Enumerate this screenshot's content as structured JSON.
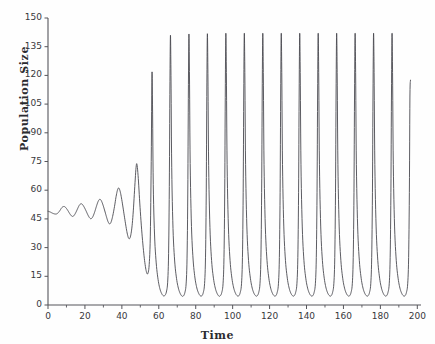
{
  "chart_data": {
    "type": "line",
    "title": "",
    "xlabel": "Time",
    "ylabel": "Population Size",
    "xlim": [
      0,
      202
    ],
    "ylim": [
      0,
      150
    ],
    "grid": false,
    "legend": null,
    "line_color": "#4a4a50",
    "background_color": "#fefefe",
    "xticks": [
      0,
      20,
      40,
      60,
      80,
      100,
      120,
      140,
      160,
      180,
      200
    ],
    "xtick_labels": [
      "0",
      "20",
      "40",
      "60",
      "80",
      "100",
      "120",
      "140",
      "160",
      "180",
      "200"
    ],
    "x_minor_tick_step": 10,
    "yticks": [
      0,
      15,
      30,
      45,
      60,
      75,
      90,
      105,
      120,
      135,
      150
    ],
    "ytick_labels": [
      "0",
      "15",
      "30",
      "45",
      "60",
      "75",
      "90",
      "105",
      "120",
      "135",
      "150"
    ],
    "series": [
      {
        "name": "Population Size",
        "initial_value": 49,
        "equilibrium": 49,
        "limit_cycle_peak": 142,
        "limit_cycle_trough": 2,
        "period": 8.6,
        "points": [
          [
            0,
            49.0
          ],
          [
            1.2,
            48.6
          ],
          [
            2.4,
            48.0
          ],
          [
            3.6,
            47.6
          ],
          [
            4.6,
            47.6
          ],
          [
            5.6,
            48.3
          ],
          [
            6.6,
            49.6
          ],
          [
            7.4,
            50.8
          ],
          [
            8.2,
            51.4
          ],
          [
            9.0,
            51.4
          ],
          [
            9.8,
            50.7
          ],
          [
            10.8,
            49.3
          ],
          [
            11.8,
            47.7
          ],
          [
            12.7,
            46.6
          ],
          [
            13.4,
            46.3
          ],
          [
            14.2,
            46.9
          ],
          [
            15.2,
            48.6
          ],
          [
            16.2,
            50.7
          ],
          [
            17.0,
            52.2
          ],
          [
            17.8,
            52.9
          ],
          [
            18.6,
            52.6
          ],
          [
            19.5,
            51.3
          ],
          [
            20.6,
            49.2
          ],
          [
            21.6,
            47.1
          ],
          [
            22.5,
            45.6
          ],
          [
            23.3,
            45.1
          ],
          [
            24.2,
            46.0
          ],
          [
            25.2,
            48.4
          ],
          [
            26.2,
            51.5
          ],
          [
            27.1,
            54.0
          ],
          [
            27.9,
            55.2
          ],
          [
            28.7,
            54.8
          ],
          [
            29.6,
            52.8
          ],
          [
            30.6,
            49.7
          ],
          [
            31.6,
            46.3
          ],
          [
            32.5,
            43.6
          ],
          [
            33.3,
            42.4
          ],
          [
            34.1,
            43.2
          ],
          [
            35.0,
            46.3
          ],
          [
            36.0,
            51.4
          ],
          [
            36.9,
            56.8
          ],
          [
            37.7,
            60.3
          ],
          [
            38.4,
            61.1
          ],
          [
            39.2,
            58.9
          ],
          [
            40.1,
            54.2
          ],
          [
            41.1,
            48.0
          ],
          [
            42.1,
            41.8
          ],
          [
            43.0,
            37.0
          ],
          [
            43.8,
            34.7
          ],
          [
            44.6,
            35.6
          ],
          [
            45.4,
            40.2
          ],
          [
            46.2,
            49.2
          ],
          [
            47.0,
            62.0
          ],
          [
            47.7,
            72.0
          ],
          [
            48.2,
            73.4
          ],
          [
            48.9,
            66.1
          ],
          [
            49.7,
            53.3
          ],
          [
            50.7,
            39.6
          ],
          [
            51.7,
            28.6
          ],
          [
            52.6,
            21.1
          ],
          [
            53.4,
            17.0
          ],
          [
            54.1,
            16.5
          ],
          [
            54.8,
            21.1
          ],
          [
            55.4,
            36.0
          ],
          [
            55.9,
            75.0
          ],
          [
            56.3,
            120.6
          ],
          [
            56.6,
            105.0
          ],
          [
            57.0,
            63.0
          ],
          [
            57.7,
            36.6
          ],
          [
            58.6,
            22.0
          ],
          [
            59.6,
            13.4
          ],
          [
            60.6,
            8.5
          ],
          [
            61.6,
            5.9
          ],
          [
            62.5,
            4.8
          ],
          [
            63.3,
            5.0
          ],
          [
            64.1,
            6.8
          ],
          [
            64.8,
            11.9
          ],
          [
            65.3,
            26.8
          ],
          [
            65.7,
            62.0
          ],
          [
            66.0,
            110.0
          ],
          [
            66.3,
            141.0
          ],
          [
            66.6,
            120.0
          ],
          [
            67.0,
            72.0
          ],
          [
            67.7,
            40.0
          ],
          [
            68.6,
            23.0
          ],
          [
            69.6,
            13.9
          ],
          [
            70.6,
            8.8
          ],
          [
            71.6,
            6.0
          ],
          [
            72.5,
            4.7
          ],
          [
            73.3,
            4.7
          ],
          [
            74.1,
            6.4
          ],
          [
            74.8,
            11.0
          ],
          [
            75.3,
            24.5
          ],
          [
            75.7,
            58.0
          ],
          [
            76.0,
            108.0
          ],
          [
            76.3,
            141.5
          ],
          [
            76.6,
            122.0
          ],
          [
            77.0,
            74.0
          ],
          [
            77.7,
            41.0
          ],
          [
            78.6,
            23.5
          ],
          [
            79.6,
            14.1
          ],
          [
            80.6,
            8.9
          ],
          [
            81.6,
            6.1
          ],
          [
            82.5,
            4.8
          ],
          [
            83.3,
            4.8
          ],
          [
            84.1,
            6.5
          ],
          [
            84.8,
            11.2
          ],
          [
            85.3,
            25.0
          ],
          [
            85.7,
            59.0
          ],
          [
            86.0,
            109.0
          ],
          [
            86.3,
            141.8
          ],
          [
            86.6,
            121.0
          ],
          [
            87.0,
            73.0
          ],
          [
            87.7,
            40.5
          ],
          [
            88.6,
            23.2
          ],
          [
            89.6,
            14.0
          ],
          [
            90.6,
            8.8
          ],
          [
            91.6,
            6.0
          ],
          [
            92.5,
            4.7
          ],
          [
            93.3,
            4.8
          ],
          [
            94.1,
            6.5
          ],
          [
            94.8,
            11.1
          ],
          [
            95.3,
            24.8
          ],
          [
            95.7,
            58.5
          ],
          [
            96.0,
            108.5
          ],
          [
            96.3,
            142.0
          ],
          [
            96.6,
            121.5
          ],
          [
            97.0,
            73.5
          ],
          [
            97.7,
            40.8
          ],
          [
            98.6,
            23.3
          ],
          [
            99.6,
            14.0
          ],
          [
            100.6,
            8.8
          ],
          [
            101.6,
            6.0
          ],
          [
            102.5,
            4.8
          ],
          [
            103.3,
            4.8
          ],
          [
            104.1,
            6.5
          ],
          [
            104.8,
            11.1
          ],
          [
            105.3,
            24.9
          ],
          [
            105.7,
            58.7
          ],
          [
            106.0,
            108.7
          ],
          [
            106.3,
            142.0
          ],
          [
            106.6,
            121.5
          ],
          [
            107.0,
            73.5
          ],
          [
            107.7,
            40.8
          ],
          [
            108.6,
            23.3
          ],
          [
            109.6,
            14.0
          ],
          [
            110.6,
            8.8
          ],
          [
            111.6,
            6.0
          ],
          [
            112.5,
            4.8
          ],
          [
            113.3,
            4.8
          ],
          [
            114.1,
            6.5
          ],
          [
            114.8,
            11.1
          ],
          [
            115.3,
            24.9
          ],
          [
            115.7,
            58.7
          ],
          [
            116.0,
            108.7
          ],
          [
            116.3,
            142.0
          ],
          [
            116.6,
            121.5
          ],
          [
            117.0,
            73.5
          ],
          [
            117.7,
            40.8
          ],
          [
            118.6,
            23.3
          ],
          [
            119.6,
            14.0
          ],
          [
            120.6,
            8.8
          ],
          [
            121.6,
            6.0
          ],
          [
            122.5,
            4.8
          ],
          [
            123.3,
            4.8
          ],
          [
            124.1,
            6.5
          ],
          [
            124.8,
            11.1
          ],
          [
            125.3,
            24.9
          ],
          [
            125.7,
            58.7
          ],
          [
            126.0,
            108.7
          ],
          [
            126.3,
            142.0
          ],
          [
            126.6,
            121.5
          ],
          [
            127.0,
            73.5
          ],
          [
            127.7,
            40.8
          ],
          [
            128.6,
            23.3
          ],
          [
            129.6,
            14.0
          ],
          [
            130.6,
            8.8
          ],
          [
            131.6,
            6.0
          ],
          [
            132.5,
            4.8
          ],
          [
            133.3,
            4.8
          ],
          [
            134.1,
            6.5
          ],
          [
            134.8,
            11.1
          ],
          [
            135.3,
            24.9
          ],
          [
            135.7,
            58.7
          ],
          [
            136.0,
            108.7
          ],
          [
            136.3,
            142.0
          ],
          [
            136.6,
            121.5
          ],
          [
            137.0,
            73.5
          ],
          [
            137.7,
            40.8
          ],
          [
            138.6,
            23.3
          ],
          [
            139.6,
            14.0
          ],
          [
            140.6,
            8.8
          ],
          [
            141.6,
            6.0
          ],
          [
            142.5,
            4.8
          ],
          [
            143.3,
            4.8
          ],
          [
            144.1,
            6.5
          ],
          [
            144.8,
            11.1
          ],
          [
            145.3,
            24.9
          ],
          [
            145.7,
            58.7
          ],
          [
            146.0,
            108.7
          ],
          [
            146.3,
            142.0
          ],
          [
            146.6,
            121.5
          ],
          [
            147.0,
            73.5
          ],
          [
            147.7,
            40.8
          ],
          [
            148.6,
            23.3
          ],
          [
            149.6,
            14.0
          ],
          [
            150.6,
            8.8
          ],
          [
            151.6,
            6.0
          ],
          [
            152.5,
            4.8
          ],
          [
            153.3,
            4.8
          ],
          [
            154.1,
            6.5
          ],
          [
            154.8,
            11.1
          ],
          [
            155.3,
            24.9
          ],
          [
            155.7,
            58.7
          ],
          [
            156.0,
            108.7
          ],
          [
            156.3,
            142.0
          ],
          [
            156.6,
            121.5
          ],
          [
            157.0,
            73.5
          ],
          [
            157.7,
            40.8
          ],
          [
            158.6,
            23.3
          ],
          [
            159.6,
            14.0
          ],
          [
            160.6,
            8.8
          ],
          [
            161.6,
            6.0
          ],
          [
            162.5,
            4.8
          ],
          [
            163.3,
            4.8
          ],
          [
            164.1,
            6.5
          ],
          [
            164.8,
            11.1
          ],
          [
            165.3,
            24.9
          ],
          [
            165.7,
            58.7
          ],
          [
            166.0,
            108.7
          ],
          [
            166.3,
            142.0
          ],
          [
            166.6,
            121.5
          ],
          [
            167.0,
            73.5
          ],
          [
            167.7,
            40.8
          ],
          [
            168.6,
            23.3
          ],
          [
            169.6,
            14.0
          ],
          [
            170.6,
            8.8
          ],
          [
            171.6,
            6.0
          ],
          [
            172.5,
            4.8
          ],
          [
            173.3,
            4.8
          ],
          [
            174.1,
            6.5
          ],
          [
            174.8,
            11.1
          ],
          [
            175.3,
            24.9
          ],
          [
            175.7,
            58.7
          ],
          [
            176.0,
            108.7
          ],
          [
            176.3,
            142.0
          ],
          [
            176.6,
            121.5
          ],
          [
            177.0,
            73.5
          ],
          [
            177.7,
            40.8
          ],
          [
            178.6,
            23.3
          ],
          [
            179.6,
            14.0
          ],
          [
            180.6,
            8.8
          ],
          [
            181.6,
            6.0
          ],
          [
            182.5,
            4.8
          ],
          [
            183.3,
            4.8
          ],
          [
            184.1,
            6.5
          ],
          [
            184.8,
            11.1
          ],
          [
            185.3,
            24.9
          ],
          [
            185.7,
            58.7
          ],
          [
            186.0,
            108.7
          ],
          [
            186.3,
            142.0
          ],
          [
            186.6,
            121.5
          ],
          [
            187.0,
            73.5
          ],
          [
            187.7,
            40.8
          ],
          [
            188.6,
            23.3
          ],
          [
            189.6,
            14.0
          ],
          [
            190.6,
            8.8
          ],
          [
            191.6,
            6.0
          ],
          [
            192.5,
            4.8
          ],
          [
            193.3,
            4.8
          ],
          [
            194.1,
            6.5
          ],
          [
            194.8,
            11.1
          ],
          [
            195.3,
            24.9
          ],
          [
            195.7,
            58.7
          ],
          [
            196.0,
            108.7
          ],
          [
            196.3,
            117.5
          ]
        ]
      }
    ]
  }
}
